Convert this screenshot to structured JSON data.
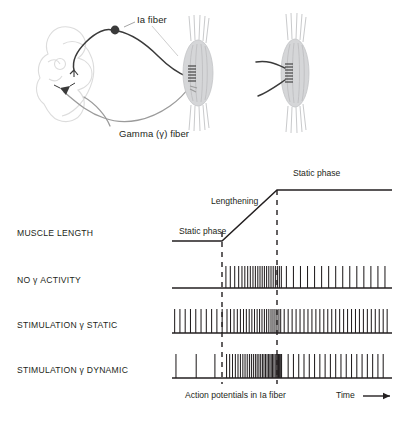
{
  "figure": {
    "title_present": false,
    "background_color": "#ffffff",
    "ink_color": "#231f20",
    "muscle_fill": "#d5d6d8",
    "cord_outline": "#dcdcdc"
  },
  "anatomy": {
    "labels": {
      "ia_fiber": "Ia fiber",
      "gamma_fiber": "Gamma (γ) fiber"
    },
    "icon_names": {
      "spinal_cord": "spinal-cord-outline-icon",
      "sensory_neuron_soma": "dorsal-root-ganglion-cell-icon",
      "motor_neuron_soma": "ventral-horn-motor-neuron-icon",
      "left_spindle": "muscle-spindle-icon",
      "right_spindle": "muscle-spindle-icon"
    }
  },
  "chart_data": {
    "type": "line",
    "title": "",
    "xlabel": "Time",
    "ylabel": "",
    "grid": false,
    "legend_position": "none",
    "axis_captions": {
      "bottom_center": "Action potentials in Ia fiber",
      "bottom_right": "Time"
    },
    "phases": [
      {
        "name": "Static phase",
        "start": 0.0,
        "end": 0.24,
        "label": "Static phase"
      },
      {
        "name": "Lengthening",
        "start": 0.24,
        "end": 0.5,
        "label": "Lengthening"
      },
      {
        "name": "Static phase",
        "start": 0.5,
        "end": 1.0,
        "label": "Static phase"
      }
    ],
    "event_markers": [
      0.24,
      0.5
    ],
    "rows": [
      {
        "label": "MUSCLE LENGTH",
        "kind": "ramp",
        "values": [
          {
            "x": 0.0,
            "y": 0.0
          },
          {
            "x": 0.24,
            "y": 0.0
          },
          {
            "x": 0.5,
            "y": 1.0
          },
          {
            "x": 1.0,
            "y": 1.0
          }
        ]
      },
      {
        "label": "NO γ ACTIVITY",
        "kind": "spike-train",
        "spike_times": [
          0.245,
          0.265,
          0.285,
          0.303,
          0.318,
          0.331,
          0.344,
          0.356,
          0.368,
          0.379,
          0.39,
          0.4,
          0.41,
          0.42,
          0.43,
          0.44,
          0.45,
          0.46,
          0.47,
          0.479,
          0.488,
          0.497,
          0.52,
          0.552,
          0.584,
          0.616,
          0.648,
          0.68,
          0.712,
          0.744,
          0.776,
          0.808,
          0.84,
          0.872,
          0.904,
          0.936,
          0.968
        ],
        "description": "silent at rest, burst during lengthening, slow regular firing after"
      },
      {
        "label": "STIMULATION  γ STATIC",
        "kind": "spike-train",
        "spike_times": [
          0.012,
          0.036,
          0.06,
          0.084,
          0.108,
          0.132,
          0.156,
          0.18,
          0.204,
          0.228,
          0.25,
          0.266,
          0.282,
          0.297,
          0.311,
          0.325,
          0.338,
          0.351,
          0.363,
          0.375,
          0.387,
          0.398,
          0.409,
          0.42,
          0.43,
          0.44,
          0.45,
          0.459,
          0.468,
          0.477,
          0.486,
          0.494,
          0.51,
          0.528,
          0.546,
          0.564,
          0.582,
          0.6,
          0.618,
          0.636,
          0.654,
          0.672,
          0.69,
          0.708,
          0.726,
          0.744,
          0.762,
          0.78,
          0.798,
          0.816,
          0.834,
          0.852,
          0.87,
          0.888,
          0.906,
          0.924,
          0.942,
          0.96,
          0.978
        ],
        "description": "steady background firing, elevated throughout, sustained after stretch"
      },
      {
        "label": "STIMULATION  γ DYNAMIC",
        "kind": "spike-train",
        "spike_times": [
          0.018,
          0.11,
          0.195,
          0.248,
          0.262,
          0.275,
          0.288,
          0.3,
          0.311,
          0.322,
          0.332,
          0.342,
          0.352,
          0.361,
          0.37,
          0.379,
          0.387,
          0.395,
          0.403,
          0.411,
          0.418,
          0.425,
          0.432,
          0.439,
          0.445,
          0.451,
          0.457,
          0.463,
          0.469,
          0.474,
          0.479,
          0.484,
          0.489,
          0.494,
          0.498,
          0.528,
          0.552,
          0.576,
          0.6,
          0.624,
          0.648,
          0.672,
          0.696,
          0.72,
          0.744,
          0.768,
          0.792,
          0.816,
          0.84,
          0.864,
          0.888,
          0.912,
          0.936,
          0.96
        ],
        "description": "sparse at rest, very dense burst during lengthening, moderate after"
      }
    ]
  }
}
